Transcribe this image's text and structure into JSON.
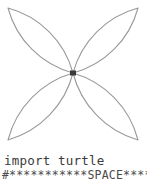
{
  "canvas": {
    "background_color": "#ffffff",
    "stroke_color": "#9a9a9a",
    "turtle_marker_color": "#3a3a3a",
    "width": 147,
    "height": 152,
    "figure_name": "four-petal-flower",
    "petal_count": 4,
    "center": {
      "x": 73,
      "y": 73
    },
    "petal_tips": [
      {
        "label": "top-left",
        "x": 8,
        "y": 8
      },
      {
        "label": "top-right",
        "x": 138,
        "y": 8
      },
      {
        "label": "bottom-right",
        "x": 138,
        "y": 140
      },
      {
        "label": "bottom-left",
        "x": 8,
        "y": 140
      }
    ]
  },
  "code": {
    "line_1": "import turtle",
    "line_2": "#***********SPACE***********"
  }
}
